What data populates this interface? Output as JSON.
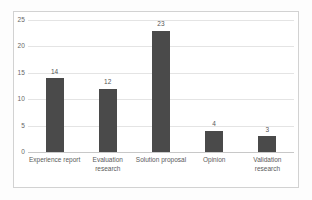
{
  "chart_data": {
    "type": "bar",
    "title": "",
    "xlabel": "",
    "ylabel": "",
    "categories": [
      "Experience report",
      "Evaluation research",
      "Solution proposal",
      "Opinion",
      "Validation research"
    ],
    "values": [
      14,
      12,
      23,
      4,
      3
    ],
    "value_labels": [
      "14",
      "12",
      "23",
      "4",
      "3"
    ],
    "ylim": [
      0,
      25
    ],
    "yticks": [
      0,
      5,
      10,
      15,
      20,
      25
    ],
    "ytick_labels": [
      "0",
      "5",
      "10",
      "15",
      "20",
      "25"
    ],
    "grid": true,
    "legend": false,
    "legend_position": "none",
    "bar_color": "#4a4a4a",
    "gridline_color": "#e4e4e4",
    "axis_color": "#c8c8c8",
    "plot_border_color": "#d2d2d2",
    "background_color": "#ffffff",
    "tick_label_color": "#666666",
    "data_label_color": "#555555"
  }
}
